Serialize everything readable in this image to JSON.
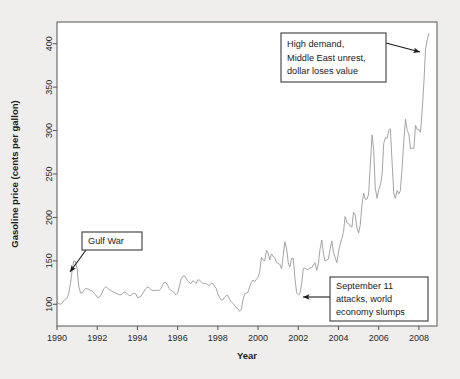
{
  "figure": {
    "background_color": "#efeeec",
    "plot_background_color": "#ffffff",
    "frame_color": "#555555",
    "line_color": "#9a9a9a",
    "annotation_border_color": "#3b3b3b",
    "arrow_color": "#1a1a1a"
  },
  "chart_data": {
    "type": "line",
    "title": "",
    "xlabel": "Year",
    "ylabel": "Gasoline price (cents per gallon)",
    "xlim": [
      1990,
      2008.9
    ],
    "ylim": [
      75,
      425
    ],
    "xticks": [
      1990,
      1992,
      1994,
      1996,
      1998,
      2000,
      2002,
      2004,
      2006,
      2008
    ],
    "yticks": [
      100,
      150,
      200,
      250,
      300,
      350,
      400
    ],
    "xtick_labels": [
      "1990",
      "1992",
      "1994",
      "1996",
      "1998",
      "2000",
      "2002",
      "2004",
      "2006",
      "2008"
    ],
    "ytick_labels": [
      "100",
      "150",
      "200",
      "250",
      "300",
      "350",
      "400"
    ],
    "grid": false,
    "legend": null,
    "series": [
      {
        "name": "Gasoline price",
        "x": [
          1990.0,
          1990.08,
          1990.17,
          1990.25,
          1990.33,
          1990.42,
          1990.5,
          1990.58,
          1990.67,
          1990.75,
          1990.83,
          1990.92,
          1991.0,
          1991.08,
          1991.17,
          1991.25,
          1991.33,
          1991.42,
          1991.5,
          1991.58,
          1991.67,
          1991.75,
          1991.83,
          1991.92,
          1992.0,
          1992.08,
          1992.17,
          1992.25,
          1992.33,
          1992.42,
          1992.5,
          1992.58,
          1992.67,
          1992.75,
          1992.83,
          1992.92,
          1993.0,
          1993.08,
          1993.17,
          1993.25,
          1993.33,
          1993.42,
          1993.5,
          1993.58,
          1993.67,
          1993.75,
          1993.83,
          1993.92,
          1994.0,
          1994.08,
          1994.17,
          1994.25,
          1994.33,
          1994.42,
          1994.5,
          1994.58,
          1994.67,
          1994.75,
          1994.83,
          1994.92,
          1995.0,
          1995.08,
          1995.17,
          1995.25,
          1995.33,
          1995.42,
          1995.5,
          1995.58,
          1995.67,
          1995.75,
          1995.83,
          1995.92,
          1996.0,
          1996.08,
          1996.17,
          1996.25,
          1996.33,
          1996.42,
          1996.5,
          1996.58,
          1996.67,
          1996.75,
          1996.83,
          1996.92,
          1997.0,
          1997.08,
          1997.17,
          1997.25,
          1997.33,
          1997.42,
          1997.5,
          1997.58,
          1997.67,
          1997.75,
          1997.83,
          1997.92,
          1998.0,
          1998.08,
          1998.17,
          1998.25,
          1998.33,
          1998.42,
          1998.5,
          1998.58,
          1998.67,
          1998.75,
          1998.83,
          1998.92,
          1999.0,
          1999.08,
          1999.17,
          1999.25,
          1999.33,
          1999.42,
          1999.5,
          1999.58,
          1999.67,
          1999.75,
          1999.83,
          1999.92,
          2000.0,
          2000.08,
          2000.17,
          2000.25,
          2000.33,
          2000.42,
          2000.5,
          2000.58,
          2000.67,
          2000.75,
          2000.83,
          2000.92,
          2001.0,
          2001.08,
          2001.17,
          2001.25,
          2001.33,
          2001.42,
          2001.5,
          2001.58,
          2001.67,
          2001.75,
          2001.83,
          2001.92,
          2002.0,
          2002.08,
          2002.17,
          2002.25,
          2002.33,
          2002.42,
          2002.5,
          2002.58,
          2002.67,
          2002.75,
          2002.83,
          2002.92,
          2003.0,
          2003.08,
          2003.17,
          2003.25,
          2003.33,
          2003.42,
          2003.5,
          2003.58,
          2003.67,
          2003.75,
          2003.83,
          2003.92,
          2004.0,
          2004.08,
          2004.17,
          2004.25,
          2004.33,
          2004.42,
          2004.5,
          2004.58,
          2004.67,
          2004.75,
          2004.83,
          2004.92,
          2005.0,
          2005.08,
          2005.17,
          2005.25,
          2005.33,
          2005.42,
          2005.5,
          2005.58,
          2005.67,
          2005.75,
          2005.83,
          2005.92,
          2006.0,
          2006.08,
          2006.17,
          2006.25,
          2006.33,
          2006.42,
          2006.5,
          2006.58,
          2006.67,
          2006.75,
          2006.83,
          2006.92,
          2007.0,
          2007.08,
          2007.17,
          2007.25,
          2007.33,
          2007.42,
          2007.5,
          2007.58,
          2007.67,
          2007.75,
          2007.83,
          2007.92,
          2008.0,
          2008.08,
          2008.17,
          2008.25,
          2008.33,
          2008.42,
          2008.5
        ],
        "values": [
          102,
          101,
          100,
          101,
          104,
          106,
          107,
          112,
          124,
          138,
          150,
          149,
          141,
          121,
          113,
          113,
          116,
          118,
          118,
          117,
          116,
          115,
          113,
          111,
          108,
          108,
          110,
          114,
          118,
          120,
          119,
          117,
          116,
          115,
          114,
          113,
          112,
          111,
          111,
          112,
          114,
          114,
          112,
          110,
          110,
          112,
          113,
          112,
          108,
          108,
          109,
          112,
          115,
          118,
          120,
          119,
          117,
          116,
          116,
          116,
          116,
          116,
          118,
          122,
          125,
          125,
          122,
          118,
          116,
          115,
          113,
          111,
          113,
          120,
          129,
          132,
          133,
          130,
          127,
          125,
          124,
          127,
          126,
          124,
          128,
          128,
          126,
          124,
          124,
          124,
          122,
          122,
          124,
          124,
          121,
          118,
          112,
          108,
          105,
          105,
          108,
          110,
          110,
          106,
          103,
          101,
          99,
          96,
          95,
          92,
          94,
          105,
          112,
          113,
          114,
          120,
          125,
          128,
          126,
          129,
          131,
          137,
          154,
          151,
          150,
          162,
          159,
          151,
          158,
          155,
          154,
          148,
          147,
          146,
          141,
          156,
          172,
          164,
          148,
          143,
          153,
          153,
          131,
          113,
          111,
          112,
          124,
          141,
          142,
          140,
          140,
          142,
          142,
          145,
          148,
          139,
          147,
          163,
          174,
          159,
          150,
          151,
          152,
          163,
          173,
          160,
          154,
          148,
          160,
          169,
          176,
          183,
          201,
          194,
          193,
          190,
          189,
          206,
          203,
          188,
          182,
          191,
          215,
          228,
          221,
          221,
          227,
          260,
          295,
          278,
          234,
          222,
          232,
          237,
          250,
          285,
          292,
          291,
          300,
          302,
          262,
          228,
          222,
          231,
          227,
          231,
          259,
          288,
          313,
          300,
          296,
          279,
          280,
          279,
          306,
          301,
          301,
          298,
          326,
          356,
          394,
          405,
          412
        ]
      }
    ],
    "annotations": [
      {
        "id": "gulf-war",
        "text_lines": [
          "Gulf War"
        ],
        "box": {
          "x": 82,
          "y": 232,
          "width": 60,
          "height": 18
        },
        "arrow_from": {
          "x": 86,
          "y": 250
        },
        "arrow_to": {
          "x": 70,
          "y": 272
        }
      },
      {
        "id": "high-demand",
        "text_lines": [
          "High demand,",
          "Middle East unrest,",
          "dollar loses value"
        ],
        "box": {
          "x": 281,
          "y": 33,
          "width": 105,
          "height": 49
        },
        "arrow_from": {
          "x": 386,
          "y": 43
        },
        "arrow_to": {
          "x": 420,
          "y": 52
        }
      },
      {
        "id": "september-11",
        "text_lines": [
          "September 11",
          "attacks, world",
          "economy slumps"
        ],
        "box": {
          "x": 330,
          "y": 277,
          "width": 98,
          "height": 44
        },
        "arrow_from": {
          "x": 330,
          "y": 297
        },
        "arrow_to": {
          "x": 303,
          "y": 297
        }
      }
    ]
  }
}
